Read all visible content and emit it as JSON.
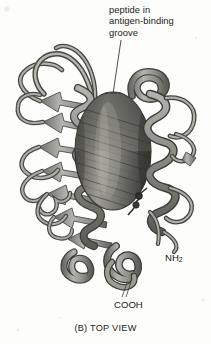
{
  "figure": {
    "panel_id": "(B)",
    "caption": "(B) TOP VIEW",
    "callouts": {
      "peptide_groove": "peptide in\nantigen-binding\ngroove",
      "peptide_groove_line1": "peptide in",
      "peptide_groove_line2": "antigen-binding",
      "peptide_groove_line3": "groove"
    },
    "terminus_labels": {
      "amino_terminus": "NH",
      "amino_terminus_subscript": "2",
      "carboxyl_terminus": "COOH"
    },
    "colors": {
      "background": "#fdfdfc",
      "ribbon_light": "#b9b9b4",
      "ribbon_mid": "#8e8e88",
      "ribbon_dark": "#5d5d58",
      "ribbon_outline": "#3a3a36",
      "peptide_fill": "#6f6f68",
      "peptide_dark": "#474742",
      "peptide_highlight": "#9a9a92",
      "text": "#1b1b1b",
      "leader_line": "#2e2e2b"
    },
    "structure_notes": {
      "central_object": "peptide-oval",
      "flanking_elements": "alpha-helix-ribbons",
      "floor_elements": "beta-strand-arrows",
      "view": "top view"
    }
  }
}
